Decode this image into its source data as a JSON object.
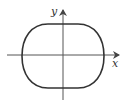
{
  "diagram": {
    "type": "closed-curve-on-axes",
    "axes": {
      "x_label": "x",
      "y_label": "y"
    },
    "curve": {
      "shape": "rounded-rectangle-like closed curve (flat top and bottom, rounded sides)",
      "stroke_color": "#333333"
    },
    "colors": {
      "axis": "#555555",
      "background": "#ffffff"
    }
  }
}
